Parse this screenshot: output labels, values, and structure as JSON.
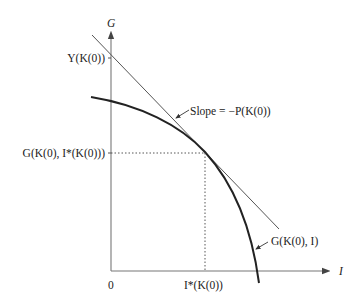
{
  "diagram": {
    "axes": {
      "y_label": "G",
      "x_label": "I",
      "origin_label": "0"
    },
    "labels": {
      "y_intercept": "Y(K(0))",
      "tangent_value": "G(K(0), I*(K(0)))",
      "slope": "Slope = −P(K(0))",
      "curve": "G(K(0), I)",
      "x_star": "I*(K(0))"
    },
    "colors": {
      "axis": "#666666",
      "curve": "#222222",
      "tangent": "#555555",
      "guide": "#444444"
    }
  }
}
